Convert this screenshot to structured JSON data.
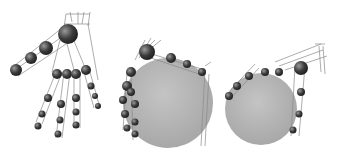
{
  "figure": {
    "panels": [
      {
        "id": "open-hand",
        "description": "Robot hand model with wireframe finger links, open pose"
      },
      {
        "id": "power-grasp-side",
        "description": "Robot hand grasping a large sphere, side view"
      },
      {
        "id": "power-grasp-front",
        "description": "Robot hand grasping a large sphere, alternate view"
      }
    ],
    "colors": {
      "background": "#ffffff",
      "sphere": "#b3b3b3",
      "joint": "#4a4a4a",
      "wire": "#8a8a8a"
    }
  }
}
